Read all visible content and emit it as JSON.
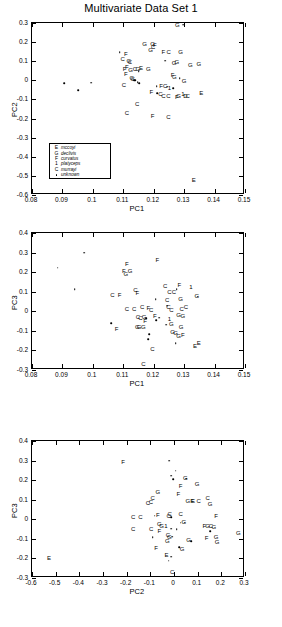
{
  "title": "Multivariate Data Set 1",
  "legend": {
    "entries": [
      {
        "symbol": "E",
        "label": "mccoyi"
      },
      {
        "symbol": "G",
        "label": "declivis"
      },
      {
        "symbol": "F",
        "label": "curvatus"
      },
      {
        "symbol": "1",
        "label": "platyceps"
      },
      {
        "symbol": "C",
        "label": "murrayi"
      },
      {
        "symbol": "dot",
        "label": "unknown"
      }
    ]
  },
  "chart_data": [
    {
      "type": "scatter",
      "title": "Multivariate Data Set 1",
      "xlabel": "PC1",
      "ylabel": "PC2",
      "xlim": [
        0.08,
        0.15
      ],
      "ylim": [
        -0.6,
        0.3
      ],
      "xticks": [
        0.08,
        0.09,
        0.1,
        0.11,
        0.12,
        0.13,
        0.14,
        0.15
      ],
      "xticklabels": [
        "0.08",
        "0.09",
        "0.1",
        "0.11",
        "0.12",
        "0.13",
        "0.14",
        "0.15"
      ],
      "yticks": [
        -0.6,
        -0.5,
        -0.4,
        -0.3,
        -0.2,
        -0.1,
        0,
        0.1,
        0.2,
        0.3
      ],
      "yticklabels": [
        "-0.6",
        "-0.5",
        "-0.4",
        "-0.3",
        "-0.2",
        "-0.1",
        "0",
        "0.1",
        "0.2",
        "0.3"
      ],
      "grid": false,
      "legend_position": "lower left",
      "points": [
        {
          "x": 0.0905,
          "y": -0.015,
          "m": "dot"
        },
        {
          "x": 0.0952,
          "y": -0.052,
          "m": "dot"
        },
        {
          "x": 0.0995,
          "y": -0.012,
          "m": "dot"
        },
        {
          "x": 0.1088,
          "y": 0.148,
          "m": "dot"
        },
        {
          "x": 0.1108,
          "y": 0.139,
          "m": "F"
        },
        {
          "x": 0.1098,
          "y": 0.112,
          "m": "C"
        },
        {
          "x": 0.1118,
          "y": 0.102,
          "m": "G"
        },
        {
          "x": 0.1122,
          "y": 0.096,
          "m": "C"
        },
        {
          "x": 0.1112,
          "y": 0.072,
          "m": "F"
        },
        {
          "x": 0.1104,
          "y": 0.06,
          "m": "F"
        },
        {
          "x": 0.1124,
          "y": 0.056,
          "m": "G"
        },
        {
          "x": 0.1138,
          "y": 0.057,
          "m": "C"
        },
        {
          "x": 0.1148,
          "y": 0.058,
          "m": "G"
        },
        {
          "x": 0.1158,
          "y": 0.062,
          "m": "E"
        },
        {
          "x": 0.115,
          "y": 0.047,
          "m": "dot"
        },
        {
          "x": 0.1108,
          "y": 0.031,
          "m": "F"
        },
        {
          "x": 0.1128,
          "y": 0.013,
          "m": "G"
        },
        {
          "x": 0.1131,
          "y": 0.006,
          "m": "C"
        },
        {
          "x": 0.1135,
          "y": 0.002,
          "m": "dot"
        },
        {
          "x": 0.114,
          "y": 0.0,
          "m": "dot"
        },
        {
          "x": 0.1102,
          "y": -0.022,
          "m": "C"
        },
        {
          "x": 0.117,
          "y": 0.19,
          "m": "G"
        },
        {
          "x": 0.1196,
          "y": 0.192,
          "m": "G"
        },
        {
          "x": 0.1204,
          "y": 0.185,
          "m": "F"
        },
        {
          "x": 0.1198,
          "y": 0.172,
          "m": "C"
        },
        {
          "x": 0.119,
          "y": 0.16,
          "m": "G"
        },
        {
          "x": 0.1232,
          "y": 0.147,
          "m": "F"
        },
        {
          "x": 0.1249,
          "y": 0.148,
          "m": "C"
        },
        {
          "x": 0.1288,
          "y": 0.148,
          "m": "G"
        },
        {
          "x": 0.1278,
          "y": 0.29,
          "m": "G"
        },
        {
          "x": 0.1296,
          "y": 0.292,
          "m": "dot"
        },
        {
          "x": 0.1238,
          "y": 0.102,
          "m": "dot"
        },
        {
          "x": 0.1267,
          "y": 0.092,
          "m": "G"
        },
        {
          "x": 0.1276,
          "y": 0.095,
          "m": "G"
        },
        {
          "x": 0.132,
          "y": 0.082,
          "m": "G"
        },
        {
          "x": 0.1348,
          "y": 0.086,
          "m": "G"
        },
        {
          "x": 0.1182,
          "y": 0.058,
          "m": "G"
        },
        {
          "x": 0.1262,
          "y": 0.026,
          "m": "F"
        },
        {
          "x": 0.1268,
          "y": 0.018,
          "m": "G"
        },
        {
          "x": 0.1286,
          "y": 0.012,
          "m": "dot"
        },
        {
          "x": 0.13,
          "y": -0.004,
          "m": "G"
        },
        {
          "x": 0.1148,
          "y": -0.01,
          "m": "dot"
        },
        {
          "x": 0.1152,
          "y": -0.014,
          "m": "dot"
        },
        {
          "x": 0.121,
          "y": -0.032,
          "m": "dot"
        },
        {
          "x": 0.1224,
          "y": -0.03,
          "m": "F"
        },
        {
          "x": 0.1238,
          "y": -0.031,
          "m": "C"
        },
        {
          "x": 0.1244,
          "y": -0.034,
          "m": "dot"
        },
        {
          "x": 0.1252,
          "y": -0.038,
          "m": "1"
        },
        {
          "x": 0.1264,
          "y": -0.042,
          "m": "dot"
        },
        {
          "x": 0.1192,
          "y": -0.06,
          "m": "F"
        },
        {
          "x": 0.1212,
          "y": -0.068,
          "m": "dot"
        },
        {
          "x": 0.1222,
          "y": -0.074,
          "m": "C"
        },
        {
          "x": 0.1232,
          "y": -0.082,
          "m": "C"
        },
        {
          "x": 0.1248,
          "y": -0.082,
          "m": "C"
        },
        {
          "x": 0.1282,
          "y": -0.08,
          "m": "G"
        },
        {
          "x": 0.1276,
          "y": -0.086,
          "m": "F"
        },
        {
          "x": 0.1296,
          "y": -0.072,
          "m": "1"
        },
        {
          "x": 0.1304,
          "y": -0.08,
          "m": "D"
        },
        {
          "x": 0.1312,
          "y": -0.082,
          "m": "C"
        },
        {
          "x": 0.1356,
          "y": -0.066,
          "m": "E"
        },
        {
          "x": 0.1146,
          "y": -0.122,
          "m": "C"
        },
        {
          "x": 0.1112,
          "y": -0.172,
          "m": "C"
        },
        {
          "x": 0.1196,
          "y": -0.186,
          "m": "F"
        },
        {
          "x": 0.1248,
          "y": -0.19,
          "m": "C"
        },
        {
          "x": 0.1332,
          "y": -0.522,
          "m": "E"
        }
      ]
    },
    {
      "type": "scatter",
      "xlabel": "PC1",
      "ylabel": "PC3",
      "xlim": [
        0.08,
        0.15
      ],
      "ylim": [
        -0.3,
        0.4
      ],
      "xticks": [
        0.08,
        0.09,
        0.1,
        0.11,
        0.12,
        0.13,
        0.14,
        0.15
      ],
      "xticklabels": [
        "0.08",
        "0.09",
        "0.1",
        "0.11",
        "0.12",
        "0.13",
        "0.14",
        "0.15"
      ],
      "yticks": [
        -0.3,
        -0.2,
        -0.1,
        0,
        0.1,
        0.2,
        0.3,
        0.4
      ],
      "yticklabels": [
        "-0.3",
        "-0.2",
        "-0.1",
        "0",
        "0.1",
        "0.2",
        "0.3",
        "0.4"
      ],
      "grid": false,
      "points": [
        {
          "x": 0.0885,
          "y": 0.222,
          "m": "dot"
        },
        {
          "x": 0.094,
          "y": 0.112,
          "m": "dot"
        },
        {
          "x": 0.0972,
          "y": 0.3,
          "m": "dot"
        },
        {
          "x": 0.106,
          "y": -0.062,
          "m": "dot"
        },
        {
          "x": 0.1112,
          "y": 0.242,
          "m": "F"
        },
        {
          "x": 0.1102,
          "y": 0.208,
          "m": "F"
        },
        {
          "x": 0.1122,
          "y": 0.206,
          "m": "G"
        },
        {
          "x": 0.1108,
          "y": 0.192,
          "m": "G"
        },
        {
          "x": 0.1064,
          "y": 0.085,
          "m": "C"
        },
        {
          "x": 0.1088,
          "y": 0.082,
          "m": "F"
        },
        {
          "x": 0.114,
          "y": 0.108,
          "m": "C"
        },
        {
          "x": 0.1146,
          "y": 0.092,
          "m": "F"
        },
        {
          "x": 0.1212,
          "y": 0.262,
          "m": "F"
        },
        {
          "x": 0.1238,
          "y": 0.128,
          "m": "C"
        },
        {
          "x": 0.1284,
          "y": 0.135,
          "m": "F"
        },
        {
          "x": 0.1252,
          "y": 0.098,
          "m": "C"
        },
        {
          "x": 0.1266,
          "y": 0.098,
          "m": "C"
        },
        {
          "x": 0.1276,
          "y": 0.112,
          "m": "dot"
        },
        {
          "x": 0.1322,
          "y": 0.122,
          "m": "1"
        },
        {
          "x": 0.1206,
          "y": 0.062,
          "m": "dot"
        },
        {
          "x": 0.1244,
          "y": 0.058,
          "m": "C"
        },
        {
          "x": 0.1288,
          "y": 0.062,
          "m": "G"
        },
        {
          "x": 0.1342,
          "y": 0.078,
          "m": "G"
        },
        {
          "x": 0.1345,
          "y": 0.074,
          "m": "dot"
        },
        {
          "x": 0.1112,
          "y": 0.012,
          "m": "C"
        },
        {
          "x": 0.1136,
          "y": 0.012,
          "m": "C"
        },
        {
          "x": 0.1162,
          "y": 0.022,
          "m": "C"
        },
        {
          "x": 0.1182,
          "y": 0.016,
          "m": "F"
        },
        {
          "x": 0.1192,
          "y": 0.008,
          "m": "C"
        },
        {
          "x": 0.1244,
          "y": 0.028,
          "m": "dot"
        },
        {
          "x": 0.1248,
          "y": 0.02,
          "m": "C"
        },
        {
          "x": 0.1258,
          "y": 0.008,
          "m": "C"
        },
        {
          "x": 0.1292,
          "y": 0.012,
          "m": "C"
        },
        {
          "x": 0.1306,
          "y": 0.022,
          "m": "C"
        },
        {
          "x": 0.1148,
          "y": -0.03,
          "m": "C"
        },
        {
          "x": 0.1156,
          "y": -0.032,
          "m": "C"
        },
        {
          "x": 0.1168,
          "y": -0.028,
          "m": "G"
        },
        {
          "x": 0.1176,
          "y": -0.034,
          "m": "dot"
        },
        {
          "x": 0.1204,
          "y": -0.022,
          "m": "F"
        },
        {
          "x": 0.1252,
          "y": -0.038,
          "m": "1"
        },
        {
          "x": 0.1282,
          "y": -0.018,
          "m": "G"
        },
        {
          "x": 0.1296,
          "y": -0.022,
          "m": "G"
        },
        {
          "x": 0.1172,
          "y": -0.048,
          "m": "F"
        },
        {
          "x": 0.1218,
          "y": -0.032,
          "m": "dot"
        },
        {
          "x": 0.1208,
          "y": -0.046,
          "m": "dot"
        },
        {
          "x": 0.1146,
          "y": -0.078,
          "m": "G"
        },
        {
          "x": 0.1152,
          "y": -0.082,
          "m": "G"
        },
        {
          "x": 0.1166,
          "y": -0.08,
          "m": "G"
        },
        {
          "x": 0.1242,
          "y": -0.068,
          "m": "dot"
        },
        {
          "x": 0.1258,
          "y": -0.066,
          "m": "G"
        },
        {
          "x": 0.129,
          "y": -0.078,
          "m": "G"
        },
        {
          "x": 0.1078,
          "y": -0.092,
          "m": "F"
        },
        {
          "x": 0.1186,
          "y": -0.118,
          "m": "dot"
        },
        {
          "x": 0.1262,
          "y": -0.108,
          "m": "G"
        },
        {
          "x": 0.1272,
          "y": -0.112,
          "m": "G"
        },
        {
          "x": 0.1282,
          "y": -0.128,
          "m": "G"
        },
        {
          "x": 0.1296,
          "y": -0.122,
          "m": "F"
        },
        {
          "x": 0.1182,
          "y": -0.142,
          "m": "dot"
        },
        {
          "x": 0.1272,
          "y": -0.162,
          "m": "dot"
        },
        {
          "x": 0.1196,
          "y": -0.192,
          "m": "C"
        },
        {
          "x": 0.1336,
          "y": -0.178,
          "m": "E"
        },
        {
          "x": 0.1348,
          "y": -0.162,
          "m": "E"
        },
        {
          "x": 0.1166,
          "y": -0.268,
          "m": "C"
        }
      ]
    },
    {
      "type": "scatter",
      "xlabel": "PC2",
      "ylabel": "PC3",
      "xlim": [
        -0.6,
        0.3
      ],
      "ylim": [
        -0.3,
        0.4
      ],
      "xticks": [
        -0.6,
        -0.5,
        -0.4,
        -0.3,
        -0.2,
        -0.1,
        0,
        0.1,
        0.2,
        0.3
      ],
      "xticklabels": [
        "-0.6",
        "-0.5",
        "-0.4",
        "-0.3",
        "-0.2",
        "-0.1",
        "0",
        "0.1",
        "0.2",
        "0.3"
      ],
      "yticks": [
        -0.3,
        -0.2,
        -0.1,
        0,
        0.1,
        0.2,
        0.3,
        0.4
      ],
      "yticklabels": [
        "-0.3",
        "-0.2",
        "-0.1",
        "0",
        "0.1",
        "0.2",
        "0.3",
        "0.4"
      ],
      "grid": false,
      "points": [
        {
          "x": -0.528,
          "y": -0.198,
          "m": "E"
        },
        {
          "x": -0.215,
          "y": 0.292,
          "m": "F"
        },
        {
          "x": -0.02,
          "y": 0.3,
          "m": "dot"
        },
        {
          "x": 0.008,
          "y": 0.248,
          "m": "dot"
        },
        {
          "x": -0.012,
          "y": 0.222,
          "m": "dot"
        },
        {
          "x": -0.004,
          "y": 0.205,
          "m": "dot"
        },
        {
          "x": 0.048,
          "y": 0.212,
          "m": "G"
        },
        {
          "x": 0.052,
          "y": 0.208,
          "m": "dot"
        },
        {
          "x": 0.098,
          "y": 0.178,
          "m": "G"
        },
        {
          "x": 0.028,
          "y": 0.172,
          "m": "F"
        },
        {
          "x": -0.068,
          "y": 0.138,
          "m": "G"
        },
        {
          "x": 0.018,
          "y": 0.128,
          "m": "F"
        },
        {
          "x": -0.09,
          "y": 0.108,
          "m": "C"
        },
        {
          "x": 0.142,
          "y": 0.108,
          "m": "C"
        },
        {
          "x": -0.11,
          "y": 0.082,
          "m": "C"
        },
        {
          "x": -0.098,
          "y": 0.088,
          "m": "C"
        },
        {
          "x": 0.058,
          "y": 0.092,
          "m": "G"
        },
        {
          "x": 0.076,
          "y": 0.095,
          "m": "F"
        },
        {
          "x": 0.08,
          "y": 0.092,
          "m": "E"
        },
        {
          "x": 0.104,
          "y": 0.092,
          "m": "C"
        },
        {
          "x": 0.152,
          "y": 0.078,
          "m": "G"
        },
        {
          "x": -0.172,
          "y": 0.01,
          "m": "C"
        },
        {
          "x": -0.142,
          "y": 0.012,
          "m": "C"
        },
        {
          "x": -0.068,
          "y": 0.022,
          "m": "F"
        },
        {
          "x": -0.082,
          "y": 0.018,
          "m": "dot"
        },
        {
          "x": -0.018,
          "y": 0.028,
          "m": "C"
        },
        {
          "x": -0.022,
          "y": 0.016,
          "m": "C"
        },
        {
          "x": -0.012,
          "y": 0.012,
          "m": "dot"
        },
        {
          "x": 0.028,
          "y": 0.026,
          "m": "C"
        },
        {
          "x": 0.178,
          "y": 0.018,
          "m": "F"
        },
        {
          "x": -0.062,
          "y": -0.022,
          "m": "G"
        },
        {
          "x": -0.052,
          "y": -0.032,
          "m": "G"
        },
        {
          "x": -0.034,
          "y": -0.036,
          "m": "1"
        },
        {
          "x": 0.028,
          "y": -0.018,
          "m": "dot"
        },
        {
          "x": 0.042,
          "y": -0.016,
          "m": "G"
        },
        {
          "x": 0.046,
          "y": -0.018,
          "m": "dot"
        },
        {
          "x": 0.128,
          "y": -0.032,
          "m": "F"
        },
        {
          "x": 0.142,
          "y": -0.032,
          "m": "G"
        },
        {
          "x": 0.156,
          "y": -0.032,
          "m": "C"
        },
        {
          "x": 0.168,
          "y": -0.038,
          "m": "G"
        },
        {
          "x": -0.096,
          "y": -0.052,
          "m": "C"
        },
        {
          "x": -0.062,
          "y": -0.062,
          "m": "F"
        },
        {
          "x": -0.012,
          "y": -0.048,
          "m": "dot"
        },
        {
          "x": 0.012,
          "y": -0.052,
          "m": "dot"
        },
        {
          "x": 0.152,
          "y": -0.062,
          "m": "dot"
        },
        {
          "x": 0.272,
          "y": -0.068,
          "m": "G"
        },
        {
          "x": -0.172,
          "y": -0.048,
          "m": "C"
        },
        {
          "x": -0.09,
          "y": -0.092,
          "m": "dot"
        },
        {
          "x": -0.026,
          "y": -0.078,
          "m": "C"
        },
        {
          "x": -0.02,
          "y": -0.088,
          "m": "G"
        },
        {
          "x": -0.008,
          "y": -0.088,
          "m": "dot"
        },
        {
          "x": 0.138,
          "y": -0.098,
          "m": "F"
        },
        {
          "x": 0.178,
          "y": -0.092,
          "m": "G"
        },
        {
          "x": -0.028,
          "y": -0.112,
          "m": "G"
        },
        {
          "x": 0.062,
          "y": -0.108,
          "m": "G"
        },
        {
          "x": 0.072,
          "y": -0.112,
          "m": "dot"
        },
        {
          "x": 0.182,
          "y": -0.118,
          "m": "G"
        },
        {
          "x": -0.076,
          "y": -0.148,
          "m": "F"
        },
        {
          "x": 0.022,
          "y": -0.142,
          "m": "dot"
        },
        {
          "x": 0.034,
          "y": -0.152,
          "m": "G"
        },
        {
          "x": -0.032,
          "y": -0.182,
          "m": "E"
        },
        {
          "x": -0.012,
          "y": -0.192,
          "m": "dot"
        },
        {
          "x": -0.022,
          "y": -0.212,
          "m": "dot"
        },
        {
          "x": -0.008,
          "y": -0.268,
          "m": "C"
        }
      ]
    }
  ]
}
